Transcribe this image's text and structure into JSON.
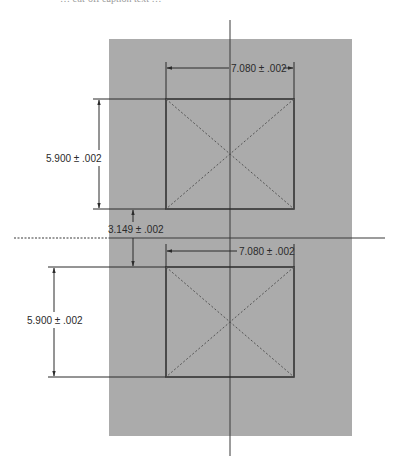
{
  "caption": {
    "text": "… cut-off caption text …"
  },
  "colors": {
    "panel": "#ababab",
    "line": "#2b2b2b",
    "hidden_line": "#555555",
    "background": "#ffffff"
  },
  "drawing": {
    "panel": {
      "x": 109,
      "y": 39,
      "width": 243,
      "height": 397
    },
    "centerlines": {
      "vertical": {
        "x": 230,
        "y1": 20,
        "y2": 456
      },
      "horizontal": {
        "y": 238,
        "x1": 14,
        "x2": 385,
        "dashed_until_x": 109
      }
    },
    "squares": [
      {
        "name": "top-square",
        "x": 166,
        "y": 99,
        "width": 128,
        "height": 110
      },
      {
        "name": "bottom-square",
        "x": 166,
        "y": 267,
        "width": 128,
        "height": 110
      }
    ],
    "dimensions": {
      "top_width": {
        "label": "7.080 ± .002",
        "value": 7.08,
        "tolerance": 0.002
      },
      "top_height": {
        "label": "5.900 ± .002",
        "value": 5.9,
        "tolerance": 0.002
      },
      "gap": {
        "label": "3.149 ± .002",
        "value": 3.149,
        "tolerance": 0.002
      },
      "bottom_width": {
        "label": "7.080 ± .002",
        "value": 7.08,
        "tolerance": 0.002
      },
      "bottom_height": {
        "label": "5.900 ± .002",
        "value": 5.9,
        "tolerance": 0.002
      }
    }
  }
}
